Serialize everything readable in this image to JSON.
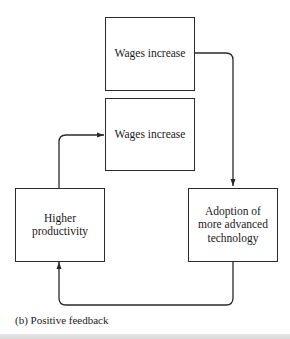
{
  "diagram": {
    "nodes": [
      {
        "id": "top",
        "lines": [
          "Wages increase"
        ]
      },
      {
        "id": "middle",
        "lines": [
          "Wages increase"
        ]
      },
      {
        "id": "left",
        "lines": [
          "Higher",
          "productivity"
        ]
      },
      {
        "id": "right",
        "lines": [
          "Adoption of",
          "more advanced",
          "technology"
        ]
      }
    ],
    "edges": [
      {
        "from": "top",
        "to": "right"
      },
      {
        "from": "right",
        "to": "left"
      },
      {
        "from": "left",
        "to": "middle"
      }
    ],
    "caption": "(b) Positive feedback"
  },
  "colors": {
    "line": "#2a2a2a",
    "background": "#ffffff",
    "band": "#dcdcdc"
  }
}
